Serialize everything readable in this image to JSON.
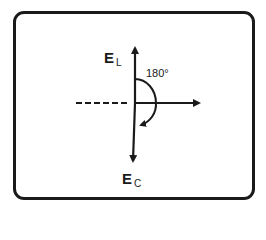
{
  "diagram": {
    "type": "phasor-diagram",
    "colors": {
      "ink": "#1a1a1a",
      "background": "#ffffff"
    },
    "vectors": {
      "up": {
        "label_main": "E",
        "label_sub": "L"
      },
      "down": {
        "label_main": "E",
        "label_sub": "C"
      },
      "reference": {
        "label": ""
      }
    },
    "angle": {
      "label": "180°"
    }
  }
}
